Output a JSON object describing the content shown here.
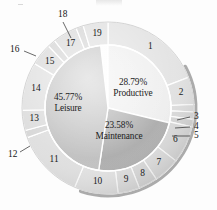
{
  "figure": {
    "title": "",
    "type": "nested-pie-chart",
    "background_color": "#fdfdfd"
  },
  "colors": {
    "productive": "#eeeeee",
    "maintenance": "#a9a9a9",
    "leisure": "#bdbdbd",
    "ring_light": "#e3e3e3",
    "ring_mid": "#d3d3d3",
    "ring_dark": "#c6c6c6",
    "shadow": "#9a9a9a",
    "separator": "#ffffff",
    "text": "#1a1a1a"
  },
  "geometry": {
    "cx": 108,
    "cy": 108,
    "r_inner": 63,
    "r_outer": 86,
    "start_angle_deg": -90
  },
  "inner_labels": [
    {
      "id": "productive",
      "percent": "28.79%",
      "name": "Productive",
      "x": 133,
      "y": 88
    },
    {
      "id": "leisure",
      "percent": "45.77%",
      "name": "Leisure",
      "x": 68,
      "y": 103
    },
    {
      "id": "maintenance",
      "percent": "23.58%",
      "name": "Maintenance",
      "x": 119,
      "y": 131
    }
  ],
  "chart_data": {
    "type": "pie",
    "title": "",
    "inner_ring": {
      "name": "Activity category",
      "categories": [
        "Productive",
        "Maintenance",
        "Leisure"
      ],
      "values": [
        28.79,
        23.58,
        45.77
      ],
      "labels": [
        "28.79% Productive",
        "23.58% Maintenance",
        "45.77% Leisure"
      ],
      "colors": [
        "#eeeeee",
        "#a9a9a9",
        "#bdbdbd"
      ],
      "units": "percent"
    },
    "outer_ring": {
      "name": "Sub-activity",
      "labels": [
        "1",
        "2",
        "3",
        "4",
        "5",
        "6",
        "7",
        "8",
        "9",
        "10",
        "11",
        "12",
        "13",
        "14",
        "15",
        "16",
        "17",
        "18",
        "19"
      ],
      "values": [
        19.4,
        5.2,
        1.4,
        1.4,
        1.4,
        7.1,
        5.0,
        3.6,
        4.1,
        8.3,
        13.2,
        1.4,
        3.8,
        9.2,
        4.2,
        1.5,
        4.7,
        1.4,
        4.7
      ],
      "units": "percent",
      "total": 100,
      "callout_labels": [
        "3",
        "4",
        "5",
        "12",
        "16",
        "18"
      ],
      "inside_labels": [
        "1",
        "2",
        "6",
        "7",
        "8",
        "9",
        "10",
        "11",
        "13",
        "14",
        "15",
        "17",
        "19"
      ]
    },
    "legend_position": "none",
    "grid": false
  },
  "ring_segments": [
    {
      "label": "1",
      "span": 19.4,
      "fill": "#e3e3e3",
      "label_pos": "inside"
    },
    {
      "label": "2",
      "span": 5.2,
      "fill": "#e0e0e0",
      "label_pos": "inside"
    },
    {
      "label": "3",
      "span": 1.4,
      "fill": "#dcdcdc",
      "label_pos": "callout",
      "callout": {
        "x": 194,
        "y": 117,
        "lx1": 177,
        "ly1": 120,
        "lx2": 190,
        "ly2": 117
      }
    },
    {
      "label": "4",
      "span": 1.4,
      "fill": "#d8d8d8",
      "label_pos": "callout",
      "callout": {
        "x": 194,
        "y": 127,
        "lx1": 175,
        "ly1": 128,
        "lx2": 190,
        "ly2": 127
      }
    },
    {
      "label": "5",
      "span": 1.4,
      "fill": "#d4d4d4",
      "label_pos": "callout",
      "callout": {
        "x": 194,
        "y": 136,
        "lx1": 172,
        "ly1": 136,
        "lx2": 190,
        "ly2": 136
      }
    },
    {
      "label": "6",
      "span": 7.1,
      "fill": "#d9d9d9",
      "label_pos": "inside"
    },
    {
      "label": "7",
      "span": 5.0,
      "fill": "#dcdcdc",
      "label_pos": "inside"
    },
    {
      "label": "8",
      "span": 3.6,
      "fill": "#d8d8d8",
      "label_pos": "inside"
    },
    {
      "label": "9",
      "span": 4.1,
      "fill": "#dddddd",
      "label_pos": "inside"
    },
    {
      "label": "10",
      "span": 8.3,
      "fill": "#e1e1e1",
      "label_pos": "inside"
    },
    {
      "label": "11",
      "span": 13.2,
      "fill": "#dedede",
      "label_pos": "inside"
    },
    {
      "label": "12",
      "span": 1.4,
      "fill": "#d6d6d6",
      "label_pos": "callout",
      "callout": {
        "x": 8,
        "y": 155,
        "lx1": 30,
        "ly1": 146,
        "lx2": 20,
        "ly2": 152
      }
    },
    {
      "label": "13",
      "span": 3.8,
      "fill": "#dcdcdc",
      "label_pos": "inside"
    },
    {
      "label": "14",
      "span": 9.2,
      "fill": "#e0e0e0",
      "label_pos": "inside"
    },
    {
      "label": "15",
      "span": 4.2,
      "fill": "#dadada",
      "label_pos": "inside"
    },
    {
      "label": "16",
      "span": 1.5,
      "fill": "#d4d4d4",
      "label_pos": "callout",
      "callout": {
        "x": 10,
        "y": 50,
        "lx1": 36,
        "ly1": 56,
        "lx2": 24,
        "ly2": 51
      }
    },
    {
      "label": "17",
      "span": 4.7,
      "fill": "#dbdbdb",
      "label_pos": "inside"
    },
    {
      "label": "18",
      "span": 1.4,
      "fill": "#d5d5d5",
      "label_pos": "callout",
      "callout": {
        "x": 58,
        "y": 15,
        "lx1": 71,
        "ly1": 38,
        "lx2": 63,
        "ly2": 22
      }
    },
    {
      "label": "19",
      "span": 4.7,
      "fill": "#e0e0e0",
      "label_pos": "inside"
    }
  ]
}
